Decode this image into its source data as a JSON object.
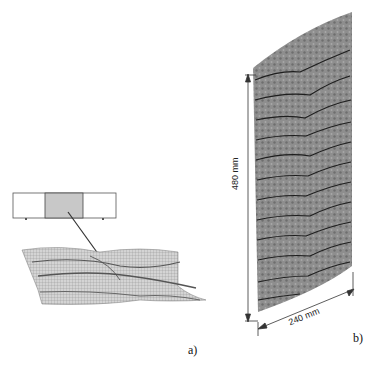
{
  "figure": {
    "panel_a": {
      "label": "a)",
      "specimen_segments": 3,
      "highlighted_segment": 2,
      "highlight_color": "#c8c8c8"
    },
    "panel_b": {
      "label": "b)",
      "height_dimension": "480 mm",
      "width_dimension": "240 mm",
      "surface_color": "#8a8a8a",
      "crack_color": "#1e1e1e"
    }
  }
}
